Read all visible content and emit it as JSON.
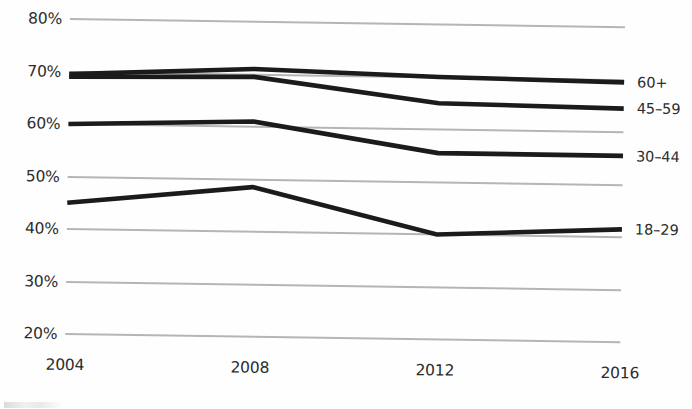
{
  "chart_data": {
    "type": "line",
    "title": "",
    "subtitle": "",
    "xlabel": "",
    "ylabel": "",
    "x": [
      2004,
      2008,
      2012,
      2016
    ],
    "xtick_labels": [
      "2004",
      "2008",
      "2012",
      "2016"
    ],
    "ytick_labels": [
      "80%",
      "70%",
      "60%",
      "50%",
      "40%",
      "30%",
      "20%"
    ],
    "ytick_values": [
      80,
      70,
      60,
      50,
      40,
      30,
      20
    ],
    "ylim": [
      20,
      80
    ],
    "yunit": "%",
    "grid": "horizontal",
    "legend_position": "right-of-line-ends",
    "line_color": "#1b1b1b",
    "gridline_color": "#b5b5b5",
    "series": [
      {
        "name": "60+",
        "label": "60+",
        "values": [
          69.5,
          71.0,
          70.0,
          69.5
        ]
      },
      {
        "name": "45-59",
        "label": "45–59",
        "values": [
          69.0,
          69.5,
          65.0,
          64.5
        ]
      },
      {
        "name": "30-44",
        "label": "30–44",
        "values": [
          60.0,
          61.0,
          55.5,
          55.5
        ]
      },
      {
        "name": "18-29",
        "label": "18–29",
        "values": [
          45.0,
          48.5,
          40.0,
          41.5
        ]
      }
    ]
  }
}
